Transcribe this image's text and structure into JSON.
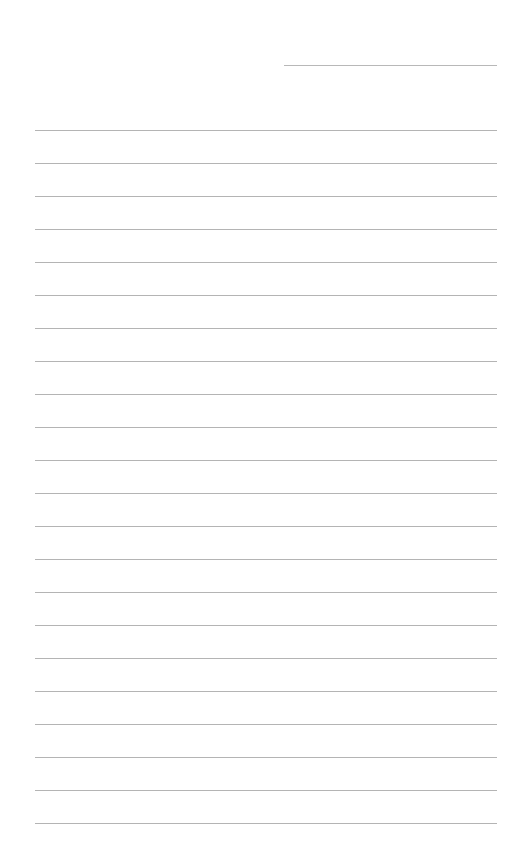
{
  "page": {
    "type": "lined-paper",
    "background": "#ffffff",
    "line_color": "#b4b4b4",
    "header_line": {
      "x": 284,
      "y": 65,
      "width": 213
    },
    "rules": {
      "start_y": 130,
      "spacing": 33,
      "count": 22,
      "x": 35,
      "width": 462
    }
  }
}
